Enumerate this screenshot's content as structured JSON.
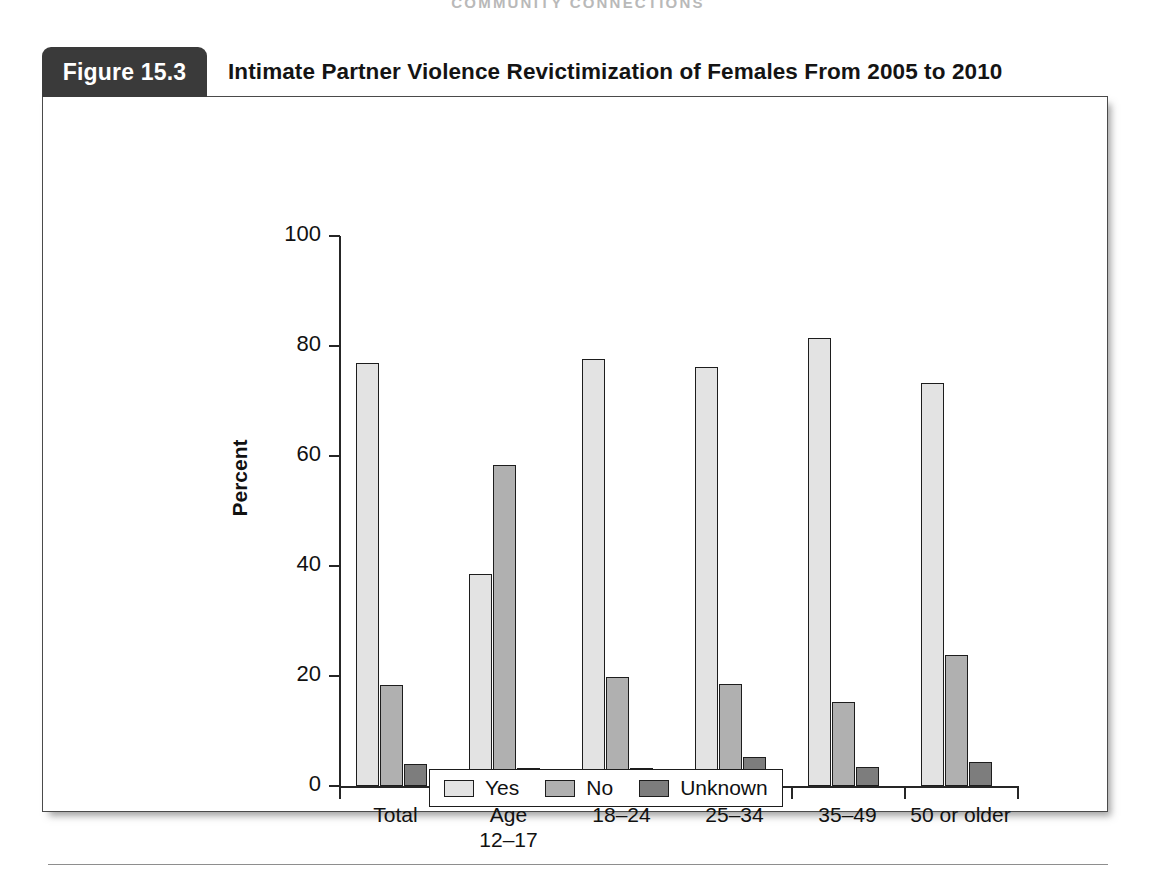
{
  "page": {
    "running_head": "COMMUNITY CONNECTIONS"
  },
  "figure": {
    "number_label": "Figure 15.3",
    "title": "Intimate Partner Violence Revictimization of Females From 2005 to 2010"
  },
  "chart_data": {
    "type": "bar",
    "title": "Intimate Partner Violence Revictimization of Females From 2005 to 2010",
    "xlabel": "",
    "ylabel": "Percent",
    "ylim": [
      0,
      100
    ],
    "yticks": [
      0,
      20,
      40,
      60,
      80,
      100
    ],
    "grid": false,
    "legend_position": "bottom",
    "categories": [
      "Total",
      "Age\n12–17",
      "18–24",
      "25–34",
      "35–49",
      "50 or older"
    ],
    "series": [
      {
        "name": "Yes",
        "color": "#e3e3e3",
        "values": [
          77.0,
          38.6,
          77.6,
          76.1,
          81.5,
          73.3
        ]
      },
      {
        "name": "No",
        "color": "#b0b0b0",
        "values": [
          18.3,
          58.4,
          19.8,
          18.5,
          15.2,
          23.9
        ]
      },
      {
        "name": "Unknown",
        "color": "#7d7d7d",
        "values": [
          4.0,
          3.2,
          3.3,
          5.3,
          3.4,
          4.3
        ]
      }
    ]
  },
  "colors": {
    "tab_background": "#3a3a3a",
    "axis": "#262626",
    "frame": "#4a4a4a"
  }
}
